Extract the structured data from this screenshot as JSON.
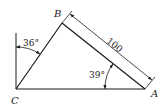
{
  "diagram": {
    "type": "triangle-geometry",
    "vertices": {
      "A": {
        "label": "A",
        "x": 145,
        "y": 89
      },
      "B": {
        "label": "B",
        "x": 62,
        "y": 23
      },
      "C": {
        "label": "C",
        "x": 16,
        "y": 89
      }
    },
    "angles": {
      "at_C_from_vertical": {
        "label": "36°",
        "value_deg": 36
      },
      "at_A": {
        "label": "39°",
        "value_deg": 39
      }
    },
    "dimensions": {
      "BA_length": {
        "label": "100",
        "value": 100
      }
    },
    "colors": {
      "stroke": "#1a1a1a",
      "background": "#ffffff"
    }
  }
}
